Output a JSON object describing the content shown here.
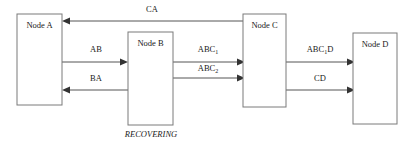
{
  "diagram": {
    "colors": {
      "box_stroke": "#7a7a7a",
      "line": "#555555",
      "arrowhead": "#333333",
      "text": "#1a1a1a",
      "background": "#ffffff"
    },
    "nodes": [
      {
        "id": "A",
        "label": "Node A",
        "x": 17,
        "y": 14,
        "w": 45,
        "h": 91
      },
      {
        "id": "B",
        "label": "Node B",
        "x": 128,
        "y": 32,
        "w": 45,
        "h": 93
      },
      {
        "id": "C",
        "label": "Node C",
        "x": 243,
        "y": 14,
        "w": 43,
        "h": 93
      },
      {
        "id": "D",
        "label": "Node D",
        "x": 353,
        "y": 33,
        "w": 44,
        "h": 91
      }
    ],
    "messages": [
      {
        "id": "ca",
        "label": "CA",
        "sub": "",
        "suffix": "",
        "from": "C",
        "to": "A",
        "direction": "left",
        "y": 21,
        "label_x": 152,
        "label_y": 12
      },
      {
        "id": "ab",
        "label": "AB",
        "sub": "",
        "suffix": "",
        "from": "A",
        "to": "B",
        "direction": "right",
        "y": 62,
        "label_x": 96,
        "label_y": 52
      },
      {
        "id": "ba",
        "label": "BA",
        "sub": "",
        "suffix": "",
        "from": "B",
        "to": "A",
        "direction": "left",
        "y": 90,
        "label_x": 96,
        "label_y": 81
      },
      {
        "id": "abc1",
        "label": "ABC",
        "sub": "1",
        "suffix": "",
        "from": "B",
        "to": "C",
        "direction": "right",
        "y": 62,
        "label_x": 208,
        "label_y": 52
      },
      {
        "id": "abc2",
        "label": "ABC",
        "sub": "2",
        "suffix": "",
        "from": "B",
        "to": "C",
        "direction": "right",
        "y": 78,
        "label_x": 208,
        "label_y": 71
      },
      {
        "id": "abc1d",
        "label": "ABC",
        "sub": "1",
        "suffix": "D",
        "from": "C",
        "to": "D",
        "direction": "right",
        "y": 62,
        "label_x": 320,
        "label_y": 52
      },
      {
        "id": "cd",
        "label": "CD",
        "sub": "",
        "suffix": "",
        "from": "C",
        "to": "D",
        "direction": "right",
        "y": 90,
        "label_x": 320,
        "label_y": 81
      }
    ],
    "annotations": [
      {
        "id": "recovering",
        "text": "RECOVERING",
        "target": "B",
        "x": 151,
        "y": 137
      }
    ]
  }
}
